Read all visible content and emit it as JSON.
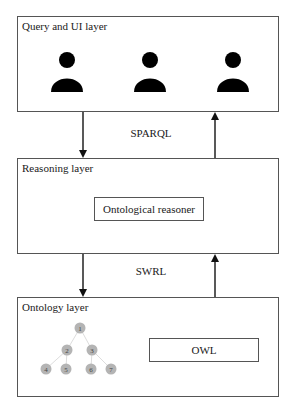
{
  "diagram": {
    "layers": [
      {
        "id": "query",
        "title": "Query and UI layer",
        "icons": [
          "user-icon",
          "user-icon",
          "user-icon"
        ]
      },
      {
        "id": "reasoning",
        "title": "Reasoning layer",
        "component": "Ontological reasoner"
      },
      {
        "id": "ontology",
        "title": "Ontology layer",
        "component": "OWL",
        "tree_nodes": [
          "1",
          "2",
          "3",
          "4",
          "5",
          "6",
          "7"
        ]
      }
    ],
    "connections": [
      {
        "from": "query",
        "to": "reasoning",
        "label": "SPARQL",
        "arrows": [
          "down",
          "up"
        ]
      },
      {
        "from": "reasoning",
        "to": "ontology",
        "label": "SWRL",
        "arrows": [
          "down",
          "up"
        ]
      }
    ],
    "colors": {
      "line": "#555555",
      "icon": "#000000",
      "node": "#b4b4b4"
    }
  }
}
